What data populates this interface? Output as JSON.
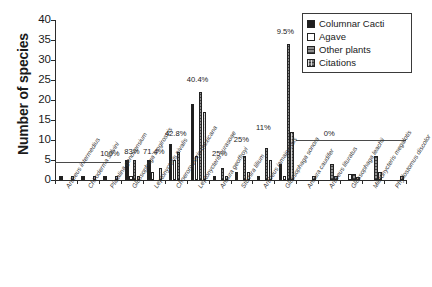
{
  "chart_data": {
    "type": "bar",
    "title": "",
    "xlabel": "",
    "ylabel": "Number of species",
    "ylim": [
      0,
      40
    ],
    "yticks": [
      0,
      5,
      10,
      15,
      20,
      25,
      30,
      35,
      40
    ],
    "grid": false,
    "legend_position": "top-right",
    "categories": [
      "Artibeus intermedius",
      "Chiroderma salvini",
      "Platalina genovensium",
      "Glossophaga longirostris",
      "Leptonycteris nivalis",
      "Choeronycteris mexicana",
      "Leptonycteris curasoae",
      "Anoura geoffroyi",
      "Sturnira lilium",
      "Artibeus jamaicensis",
      "Glossophaga sonora",
      "Anoura caudifer",
      "Artibeus lituratus",
      "Glossophaga leachii",
      "Micronycteris megalotis",
      "Phyllostomus discolor"
    ],
    "series": [
      {
        "name": "Columnar Cacti",
        "color": "#1e1e1e",
        "values": [
          1,
          1,
          1,
          5,
          5,
          9,
          19,
          1,
          2,
          1,
          4,
          0,
          0,
          0,
          0,
          0
        ]
      },
      {
        "name": "Agave",
        "color": "#ffffff",
        "values": [
          0,
          0,
          0,
          1,
          2,
          5,
          6,
          0,
          0,
          0,
          1,
          0,
          0,
          1.5,
          0,
          0
        ]
      },
      {
        "name": "Other plants",
        "color": "#8e8e8e",
        "values": [
          0,
          0,
          0,
          5,
          0,
          7,
          22,
          3,
          6,
          8,
          34,
          0,
          4,
          1.5,
          6,
          0
        ]
      },
      {
        "name": "Citations",
        "color": "#777777",
        "values": [
          1,
          1,
          1,
          1,
          3,
          0,
          17,
          1,
          2,
          5,
          12,
          1,
          1,
          0.8,
          2,
          1
        ]
      }
    ],
    "annotations": [
      {
        "text": "100%",
        "category": "Platalina genovensium",
        "value": 6.0
      },
      {
        "text": "83%",
        "category": "Glossophaga longirostris",
        "value": 6.5
      },
      {
        "text": "71.4%",
        "category": "Leptonycteris nivalis",
        "value": 6.5
      },
      {
        "text": "42.8%",
        "category": "Choeronycteris mexicana",
        "value": 11.0
      },
      {
        "text": "40.4%",
        "category": "Leptonycteris curasoae",
        "value": 24.5
      },
      {
        "text": "25%",
        "category": "Anoura geoffroyi",
        "value": 6.0
      },
      {
        "text": "25%",
        "category": "Sturnira lilium",
        "value": 9.5
      },
      {
        "text": "11%",
        "category": "Artibeus jamaicensis",
        "value": 12.5
      },
      {
        "text": "9.5%",
        "category": "Glossophaga sonora",
        "value": 36.5
      },
      {
        "text": "0%",
        "category": "Artibeus lituratus",
        "value": 11.0
      }
    ],
    "reference_lines": [
      {
        "label": "100%-group-line",
        "value": 4.6,
        "from_category": "Artibeus intermedius",
        "to_category": "Platalina genovensium"
      },
      {
        "label": "0%-group-line",
        "value": 10.0,
        "from_category": "Anoura caudifer",
        "to_category": "Phyllostomus discolor"
      }
    ]
  },
  "legend": {
    "items": [
      {
        "label": "Columnar Cacti"
      },
      {
        "label": "Agave"
      },
      {
        "label": "Other plants"
      },
      {
        "label": "Citations"
      }
    ]
  },
  "axis": {
    "y_title": "Number of species",
    "y_tick_labels": [
      "40",
      "35",
      "30",
      "25",
      "20",
      "15",
      "10",
      "5",
      "0"
    ]
  }
}
